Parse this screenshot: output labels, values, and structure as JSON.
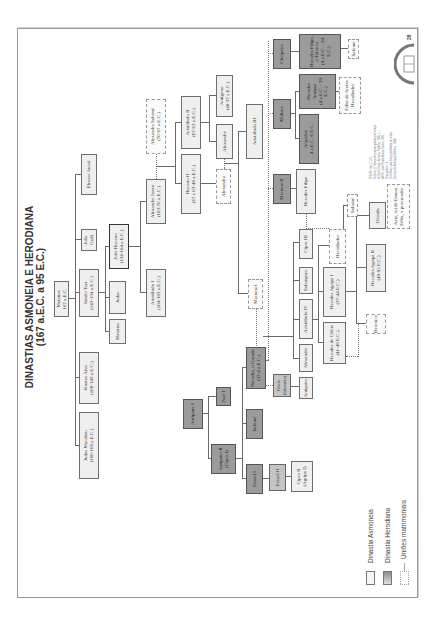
{
  "document": {
    "orientation": "rotated -90deg (landscape page on portrait scan)",
    "title_line1": "DINASTIAS ASMONEIA E HERODIANA",
    "title_line2": "(167 a.E.C. a 95 E.C.)",
    "page_number": "28"
  },
  "tree": {
    "asmonean": {
      "matatias": {
        "name": "Matatias",
        "date": "167 a.E.C."
      },
      "gen1": [
        {
          "name": "Judas Macabeu",
          "date": "(166-160 a.E.C.)"
        },
        {
          "name": "Jônatas Áfus",
          "date": "(160-143 a.E.C.)"
        },
        {
          "name": "Simão Tasi",
          "date": "(143-134 a.E.C.)"
        },
        {
          "name": "João Gadi",
          "date": ""
        },
        {
          "name": "Eleazar Auarã",
          "date": ""
        }
      ],
      "gen2": [
        {
          "name": "Matatias",
          "date": ""
        },
        {
          "name": "Judas",
          "date": ""
        },
        {
          "name": "João Hircano",
          "date": "(134-104 a.E.C.)"
        }
      ],
      "gen3": [
        {
          "name": "Aristóbulo I",
          "date": "(104-103 a.E.C.)"
        },
        {
          "name": "Alexandre Janeu",
          "date": "(103-76 a.E.C.)"
        },
        {
          "name": "Alexandra Salomé",
          "date": "(76-67 a.E.C.)"
        }
      ],
      "gen4": [
        {
          "name": "Hircano II",
          "date": "(67 e 63-40 a.E.C.)"
        },
        {
          "name": "Aristóbulo II",
          "date": "(67-63 a.E.C.)"
        }
      ],
      "gen5": [
        {
          "name": "Alexandra",
          "date": ""
        },
        {
          "name": "Alexandre",
          "date": ""
        },
        {
          "name": "Antígono",
          "date": "(40-37 a.E.C.)"
        }
      ],
      "gen6": [
        {
          "name": "Mariana I",
          "date": ""
        },
        {
          "name": "Aristóbulo III",
          "date": ""
        }
      ]
    },
    "herodian": {
      "antipater1": {
        "name": "Antipater I"
      },
      "jose1": {
        "name": "José I"
      },
      "antipater2": {
        "name": "Antipater II",
        "date": "(Cipro I)"
      },
      "salome1": {
        "name": "Salomé"
      },
      "fasael1": {
        "name": "Fasael I"
      },
      "fasael2": {
        "name": "Fasael II"
      },
      "cipro2": {
        "name": "Cipro II",
        "date": "(Agripa I)"
      },
      "herodes_grande": {
        "name": "Herodes, o Grande",
        "date": "(37-4 a.E.C.)"
      },
      "doris": {
        "name": "Dóris",
        "date": "(Iduméia)"
      },
      "mariana2": {
        "name": "Mariana II"
      },
      "maltace": {
        "name": "Maltace"
      },
      "cleopatra": {
        "name": "Cleópatra"
      },
      "children": [
        {
          "name": "Antipater"
        },
        {
          "name": "Alexandre"
        },
        {
          "name": "Aristóbulo IV"
        },
        {
          "name": "Salampsio"
        },
        {
          "name": "Cipro III"
        },
        {
          "name": "Herodes Filipe"
        },
        {
          "name": "Arquelau",
          "date": "4 a.E.C.-6 E.C."
        },
        {
          "name": "Herodes Antipas",
          "date": "(4 a.E.C. - 39 E.C.)"
        },
        {
          "name": "Herodes Filipe, o Tetrarca",
          "date": "(4 a.E.C. - 34 E.C.)"
        }
      ],
      "grandchildren": [
        {
          "name": "Herodes de Cálcis",
          "date": "(41-48 E.C.)"
        },
        {
          "name": "Herodes Agripa I",
          "date": "(37-44 E.C.)"
        },
        {
          "name": "Herodíades"
        },
        {
          "name": "Salomé"
        },
        {
          "name": "Filha de Aretas"
        },
        {
          "name": "Herodíades"
        },
        {
          "name": "Salomé"
        }
      ],
      "great_grandchildren": [
        {
          "name": "Berenice"
        },
        {
          "name": "Herodes Agripa II",
          "date": "(48-95 E.C.)"
        },
        {
          "name": "Drusila"
        },
        {
          "name": "Aziz, rei de Emesa"
        },
        {
          "name": "Félix, o procurador"
        }
      ]
    }
  },
  "legend": {
    "items": [
      {
        "label": "Dinastia Asmoneia",
        "swatch": "#f2f2f2"
      },
      {
        "label": "Dinastia Herodiana",
        "swatch": "#9b9b9b"
      },
      {
        "label": "Uniões matrimoniais",
        "swatch": "dotted"
      }
    ]
  },
  "footnote": {
    "lines": [
      "FONTE: Vol. 2, 2-5;",
      "Schürer, E. Storia del popolo giudaico al tempo",
      "di Gesù Cristo. Brescia, Paideia, 1985, v. 1",
      "ARTE: José Paulo Moura Castro, 2001",
      "Veja gráfico 13.",
      "Ver folhas uma linha pontilhada de união",
      "Serviço de Animação Bíblica - SAB"
    ]
  },
  "copyright": "© Pia Sociedade Filhas de São Paulo, 2001",
  "colors": {
    "asmonean_fill": "#f2f2f2",
    "herodian_fill": "#9b9b9b",
    "herodian_light": "#c4c4c4",
    "border": "#6e6e6e",
    "line": "#6a6a6a"
  }
}
